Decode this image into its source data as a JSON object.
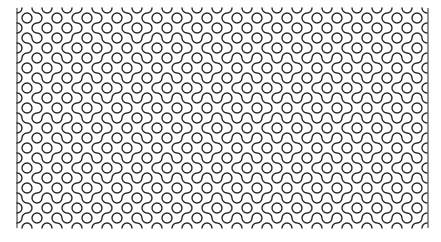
{
  "pattern": {
    "type": "truchet-quarter-arcs",
    "origin_x": 17,
    "origin_y": 8,
    "tile_size": 10,
    "cols": 41,
    "rows": 22,
    "stroke_color": "#2b2b2b",
    "stroke_width": 1.4,
    "background": "#ffffff",
    "border_left": true,
    "border_right": true,
    "tiles": [
      "01101001101100101101001011010010110100101",
      "10010110010011010010110100101101001011010",
      "01101001101100101101001011010010110100101",
      "11010010110100101100110100101101001011001",
      "00101101001011010011001011010010110100110",
      "01011010010110100101101001011010010110100",
      "10100101101001011010010110100101101001011",
      "01101001011010010110100101101001011010010",
      "10010110100101101001011010010110100101101",
      "01101001101100101101001011010010110100101",
      "10010110010011010010110100101101001011010",
      "11010010110100101100110100101101001011001",
      "00101101001011010011001011010010110100110",
      "01011010010110100101101001011010010110100",
      "10100101101001011010010110100101101001011",
      "01101001011010010110100101101001011010010",
      "10010110100101101001011010010110100101101",
      "01101001101100101101001011010010110100101",
      "10010110010011010010110100101101001011010",
      "11010010110100101100110100101101001011001",
      "00101101001011010011001011010010110100110",
      "01011010010110100101101001011010010110100"
    ]
  }
}
